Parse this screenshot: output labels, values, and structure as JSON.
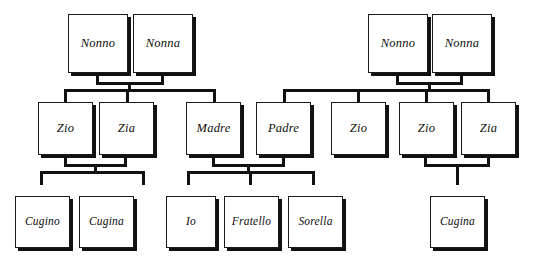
{
  "diagram": {
    "language": "Italian",
    "line_color": "#111111",
    "box_fill": "#ffffff",
    "box_border": "#1a1a1a",
    "shadow_color": "#111111"
  },
  "generations": {
    "grandparents": {
      "maternal": [
        {
          "id": "g1-nonno",
          "label": "Nonno"
        },
        {
          "id": "g1-nonna",
          "label": "Nonna"
        }
      ],
      "paternal": [
        {
          "id": "g2-nonno",
          "label": "Nonno"
        },
        {
          "id": "g2-nonna",
          "label": "Nonna"
        }
      ]
    },
    "parents": [
      {
        "id": "p-zio-1",
        "label": "Zio"
      },
      {
        "id": "p-zia-1",
        "label": "Zia"
      },
      {
        "id": "p-madre",
        "label": "Madre"
      },
      {
        "id": "p-padre",
        "label": "Padre"
      },
      {
        "id": "p-zio-2",
        "label": "Zio"
      },
      {
        "id": "p-zio-3",
        "label": "Zio"
      },
      {
        "id": "p-zia-2",
        "label": "Zia"
      }
    ],
    "children": [
      {
        "id": "c-cugino-1",
        "label": "Cugino"
      },
      {
        "id": "c-cugina-1",
        "label": "Cugina"
      },
      {
        "id": "c-io",
        "label": "Io"
      },
      {
        "id": "c-fratello",
        "label": "Fratello"
      },
      {
        "id": "c-sorella",
        "label": "Sorella"
      },
      {
        "id": "c-cugina-2",
        "label": "Cugina"
      }
    ]
  }
}
